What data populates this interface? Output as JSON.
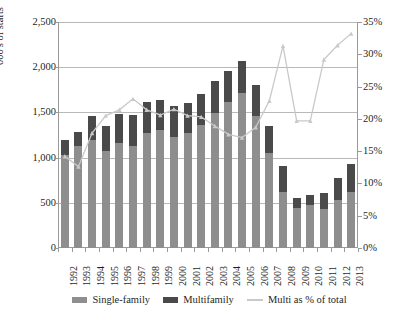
{
  "chart_data": {
    "type": "bar",
    "title": "",
    "xlabel": "",
    "ylabel": "000's of starts",
    "y2label": "",
    "ylim": [
      0,
      2500
    ],
    "y2lim": [
      0,
      0.35
    ],
    "grid": true,
    "legend_position": "bottom",
    "categories": [
      "1992",
      "1993",
      "1994",
      "1995",
      "1996",
      "1997",
      "1998",
      "1999",
      "2000",
      "2001",
      "2002",
      "2003",
      "2004",
      "2005",
      "2006",
      "2007",
      "2008",
      "2009",
      "2010",
      "2011",
      "2012",
      "2013"
    ],
    "series": [
      {
        "name": "Single-family",
        "type": "bar",
        "stack": "starts",
        "color": "#8e8e8e",
        "values": [
          1030,
          1126,
          1198,
          1076,
          1161,
          1134,
          1271,
          1302,
          1231,
          1273,
          1359,
          1499,
          1611,
          1716,
          1465,
          1046,
          622,
          445,
          471,
          431,
          535,
          618
        ]
      },
      {
        "name": "Multifamily",
        "type": "bar",
        "stack": "starts",
        "color": "#4a4a4a",
        "values": [
          170,
          162,
          259,
          278,
          316,
          340,
          346,
          339,
          338,
          329,
          346,
          349,
          345,
          355,
          336,
          309,
          284,
          109,
          116,
          178,
          245,
          307
        ]
      },
      {
        "name": "Multi as % of total",
        "type": "line",
        "axis": "right",
        "color": "#c9c9c9",
        "values": [
          0.142,
          0.126,
          0.178,
          0.205,
          0.214,
          0.231,
          0.214,
          0.206,
          0.215,
          0.205,
          0.203,
          0.189,
          0.176,
          0.171,
          0.187,
          0.228,
          0.313,
          0.197,
          0.197,
          0.292,
          0.314,
          0.332
        ]
      }
    ],
    "yticks": [
      "0",
      "500",
      "1,000",
      "1,500",
      "2,000",
      "2,500"
    ],
    "y2ticks": [
      "0%",
      "5%",
      "10%",
      "15%",
      "20%",
      "25%",
      "30%",
      "35%"
    ]
  },
  "legend": {
    "items": [
      {
        "label": "Single-family",
        "marker": "swatch",
        "color": "#8e8e8e"
      },
      {
        "label": "Multifamily",
        "marker": "swatch",
        "color": "#4a4a4a"
      },
      {
        "label": "Multi as % of total",
        "marker": "line",
        "color": "#c9c9c9"
      }
    ]
  }
}
